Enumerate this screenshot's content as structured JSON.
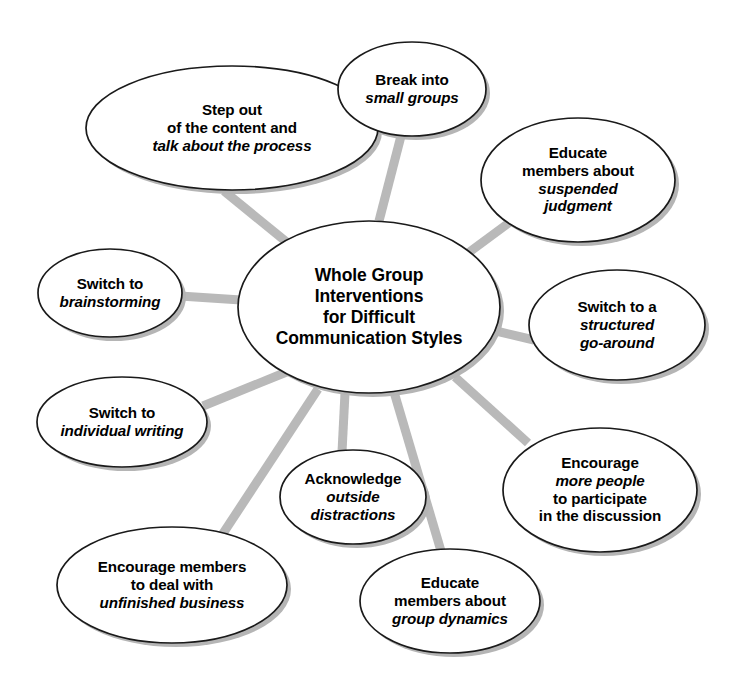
{
  "diagram": {
    "type": "radial-mind-map",
    "background_color": "#ffffff",
    "connector_color": "#b9b9b9",
    "node_fill": "#ffffff",
    "node_stroke": "#1a1a1a",
    "text_color": "#000000",
    "center": {
      "name": "center-node",
      "lines": [
        {
          "text": "Whole Group",
          "italic": false
        },
        {
          "text": "Interventions",
          "italic": false
        },
        {
          "text": "for Difficult",
          "italic": false
        },
        {
          "text": "Communication Styles",
          "italic": false
        }
      ]
    },
    "nodes": [
      {
        "id": "step-out",
        "lines": [
          {
            "text": "Step out",
            "italic": false
          },
          {
            "text": "of the content and",
            "italic": false
          },
          {
            "text": "talk about the process",
            "italic": true
          }
        ]
      },
      {
        "id": "break-into-small-groups",
        "lines": [
          {
            "text": "Break into",
            "italic": false
          },
          {
            "text": "small groups",
            "italic": true
          }
        ]
      },
      {
        "id": "suspended-judgment",
        "lines": [
          {
            "text": "Educate",
            "italic": false
          },
          {
            "text": "members about",
            "italic": false
          },
          {
            "text": "suspended",
            "italic": true
          },
          {
            "text": "judgment",
            "italic": true
          }
        ]
      },
      {
        "id": "brainstorming",
        "lines": [
          {
            "text": "Switch to",
            "italic": false
          },
          {
            "text": "brainstorming",
            "italic": true
          }
        ]
      },
      {
        "id": "structured-go-around",
        "lines": [
          {
            "text": "Switch to a",
            "italic": false
          },
          {
            "text": "structured",
            "italic": true
          },
          {
            "text": "go-around",
            "italic": true
          }
        ]
      },
      {
        "id": "individual-writing",
        "lines": [
          {
            "text": "Switch to",
            "italic": false
          },
          {
            "text": "individual writing",
            "italic": true
          }
        ]
      },
      {
        "id": "more-people-participate",
        "lines": [
          {
            "text": "Encourage",
            "italic": false
          },
          {
            "text": "more people",
            "italic": true
          },
          {
            "text": "to participate",
            "italic": false
          },
          {
            "text": "in the discussion",
            "italic": false
          }
        ]
      },
      {
        "id": "outside-distractions",
        "lines": [
          {
            "text": "Acknowledge",
            "italic": false
          },
          {
            "text": "outside",
            "italic": true
          },
          {
            "text": "distractions",
            "italic": true
          }
        ]
      },
      {
        "id": "unfinished-business",
        "lines": [
          {
            "text": "Encourage members",
            "italic": false
          },
          {
            "text": "to deal with",
            "italic": false
          },
          {
            "text": "unfinished business",
            "italic": true
          }
        ]
      },
      {
        "id": "group-dynamics",
        "lines": [
          {
            "text": "Educate",
            "italic": false
          },
          {
            "text": "members about",
            "italic": false
          },
          {
            "text": "group dynamics",
            "italic": true
          }
        ]
      }
    ]
  },
  "geometry": {
    "center": {
      "cx": 369,
      "cy": 307,
      "rx": 131,
      "ry": 86
    },
    "nodes": {
      "step-out": {
        "cx": 232,
        "cy": 128,
        "rx": 146,
        "ry": 62
      },
      "break-into-small-groups": {
        "cx": 412,
        "cy": 89,
        "rx": 74,
        "ry": 47
      },
      "suspended-judgment": {
        "cx": 578,
        "cy": 180,
        "rx": 97,
        "ry": 62
      },
      "brainstorming": {
        "cx": 110,
        "cy": 293,
        "rx": 72,
        "ry": 44
      },
      "structured-go-around": {
        "cx": 617,
        "cy": 325,
        "rx": 88,
        "ry": 55
      },
      "individual-writing": {
        "cx": 122,
        "cy": 422,
        "rx": 85,
        "ry": 45
      },
      "more-people-participate": {
        "cx": 600,
        "cy": 490,
        "rx": 97,
        "ry": 62
      },
      "outside-distractions": {
        "cx": 353,
        "cy": 497,
        "rx": 73,
        "ry": 47
      },
      "unfinished-business": {
        "cx": 172,
        "cy": 585,
        "rx": 115,
        "ry": 58
      },
      "group-dynamics": {
        "cx": 450,
        "cy": 601,
        "rx": 90,
        "ry": 52
      }
    }
  }
}
